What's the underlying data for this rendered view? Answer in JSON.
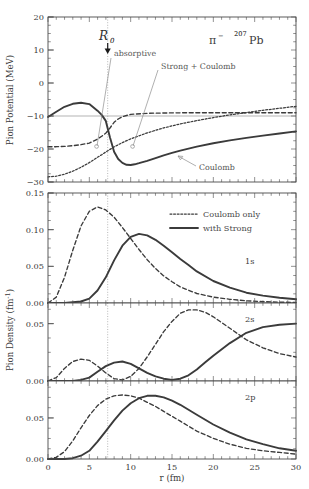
{
  "figure": {
    "system_label": "π⁻  ²⁰⁷Pb",
    "pion_symbol": "π",
    "pion_charge": "−",
    "target_mass": "207",
    "target_element": "Pb",
    "r0_label": "R",
    "r0_sub": "0",
    "r0_value": 6.5
  },
  "xaxis": {
    "label": "r (fm)",
    "min": 0,
    "max": 30,
    "ticks": [
      0,
      5,
      10,
      15,
      20,
      25,
      30
    ],
    "ticklabels": [
      "0",
      "5",
      "10",
      "15",
      "20",
      "25",
      "30"
    ],
    "minor_step": 1
  },
  "panels": {
    "potential": {
      "ylabel": "Pion Potential (MeV)",
      "ymin": -30,
      "ymax": 20,
      "ticks": [
        -30,
        -20,
        -10,
        0,
        10,
        20
      ],
      "ticklabels": [
        "−30",
        "−20",
        "−10",
        "0",
        "10",
        "20"
      ],
      "minor_step": 2.5,
      "annotations": [
        {
          "name": "absorptive",
          "text": "absorptive"
        },
        {
          "name": "strong-plus-coulomb",
          "text": "Strong + Coulomb"
        },
        {
          "name": "coulomb",
          "text": "Coulomb"
        }
      ]
    },
    "density_1s": {
      "ylabel": "Pion Density (fm⁻¹)",
      "state": "1s",
      "ymin": 0.0,
      "ymax": 0.15,
      "ticks": [
        0.0,
        0.05,
        0.1,
        0.15
      ],
      "ticklabels": [
        "0.00",
        "0.05",
        "0.10",
        "0.15"
      ],
      "minor_step": 0.0125
    },
    "density_2s": {
      "state": "2s",
      "ymin": 0.0,
      "ymax": 0.068,
      "ticks": [
        0.0,
        0.05
      ],
      "ticklabels": [
        "0.00",
        "0.05"
      ],
      "minor_step": 0.0125
    },
    "density_2p": {
      "state": "2p",
      "ymin": 0.0,
      "ymax": 0.095,
      "ticks": [
        0.0,
        0.05
      ],
      "ticklabels": [
        "0.00",
        "0.05"
      ],
      "minor_step": 0.0125
    }
  },
  "legend": {
    "position": "upper-center-right of 1s panel",
    "entries": [
      {
        "name": "coulomb-only",
        "label": "Coulomb only",
        "style": "dashed"
      },
      {
        "name": "with-strong",
        "label": "with Strong",
        "style": "solid"
      }
    ]
  },
  "chart_data": [
    {
      "type": "line",
      "name": "pion-potential",
      "title": "Pion Potential vs r",
      "xlabel": "r (fm)",
      "ylabel": "Pion Potential (MeV)",
      "xlim": [
        0,
        30
      ],
      "ylim": [
        -30,
        20
      ],
      "grid": false,
      "legend_position": "none",
      "annotations": [
        "R_0 at r = 6.5 fm",
        "absorptive",
        "Strong + Coulomb",
        "Coulomb"
      ],
      "x": [
        0,
        1,
        2,
        3,
        4,
        5,
        6,
        6.5,
        7,
        7.5,
        8,
        9,
        10,
        12,
        14,
        16,
        18,
        20,
        22,
        24,
        26,
        28,
        30
      ],
      "series": [
        {
          "name": "Strong + Coulomb (total, solid)",
          "style": "solid",
          "values": [
            -0.3,
            1.3,
            2.8,
            3.7,
            4.0,
            3.6,
            1.6,
            -1.5,
            -6.5,
            -10.8,
            -13.0,
            -13.6,
            -13.2,
            -11.8,
            -10.4,
            -9.2,
            -8.2,
            -7.3,
            -6.5,
            -5.8,
            -5.2,
            -4.6,
            -4.0
          ]
        },
        {
          "name": "absorptive (dashed)",
          "style": "dashed",
          "values": [
            -9.3,
            -9.3,
            -9.2,
            -9.0,
            -8.7,
            -8.2,
            -7.0,
            -5.2,
            -3.0,
            -1.2,
            -0.2,
            0.5,
            0.8,
            0.9,
            0.95,
            1.0,
            1.0,
            1.0,
            1.0,
            1.0,
            1.0,
            1.0,
            1.0
          ]
        },
        {
          "name": "Coulomb (dotted)",
          "style": "dotted",
          "values": [
            -26.3,
            -26.1,
            -25.5,
            -24.6,
            -23.4,
            -22.0,
            -20.4,
            -19.6,
            -18.8,
            -18.0,
            -17.3,
            -16.0,
            -14.9,
            -13.1,
            -11.6,
            -10.4,
            -9.4,
            -8.5,
            -7.7,
            -7.0,
            -6.3,
            -5.7,
            -5.1
          ]
        }
      ]
    },
    {
      "type": "line",
      "name": "pion-density-1s",
      "title": "1s pion density",
      "xlabel": "r (fm)",
      "ylabel": "Pion Density (fm⁻¹)",
      "xlim": [
        0,
        30
      ],
      "ylim": [
        0.0,
        0.15
      ],
      "state": "1s",
      "x": [
        0,
        1,
        2,
        3,
        4,
        5,
        6,
        7,
        8,
        9,
        10,
        11,
        12,
        13,
        14,
        15,
        16,
        18,
        20,
        22,
        24,
        26,
        28,
        30
      ],
      "series": [
        {
          "name": "Coulomb only",
          "style": "dashed",
          "values": [
            0.0,
            0.008,
            0.035,
            0.072,
            0.105,
            0.125,
            0.131,
            0.127,
            0.117,
            0.103,
            0.088,
            0.073,
            0.059,
            0.047,
            0.037,
            0.029,
            0.022,
            0.013,
            0.008,
            0.005,
            0.003,
            0.002,
            0.001,
            0.001
          ]
        },
        {
          "name": "with Strong",
          "style": "solid",
          "values": [
            0.0,
            0.0,
            0.0,
            0.001,
            0.002,
            0.006,
            0.017,
            0.035,
            0.058,
            0.078,
            0.09,
            0.094,
            0.092,
            0.086,
            0.078,
            0.069,
            0.06,
            0.043,
            0.03,
            0.021,
            0.014,
            0.01,
            0.007,
            0.005
          ]
        }
      ]
    },
    {
      "type": "line",
      "name": "pion-density-2s",
      "title": "2s pion density",
      "xlabel": "r (fm)",
      "ylabel": "Pion Density (fm⁻¹)",
      "xlim": [
        0,
        30
      ],
      "ylim": [
        0.0,
        0.068
      ],
      "state": "2s",
      "x": [
        0,
        1,
        2,
        3,
        4,
        5,
        6,
        7,
        8,
        9,
        10,
        11,
        12,
        13,
        14,
        15,
        16,
        17,
        18,
        19,
        20,
        22,
        24,
        26,
        28,
        30
      ],
      "series": [
        {
          "name": "Coulomb only",
          "style": "dashed",
          "values": [
            0.0,
            0.003,
            0.011,
            0.017,
            0.019,
            0.018,
            0.013,
            0.007,
            0.002,
            0.001,
            0.004,
            0.011,
            0.021,
            0.032,
            0.043,
            0.052,
            0.059,
            0.062,
            0.062,
            0.06,
            0.056,
            0.046,
            0.036,
            0.029,
            0.024,
            0.021
          ]
        },
        {
          "name": "with Strong",
          "style": "solid",
          "values": [
            0.0,
            0.0,
            0.0,
            0.0,
            0.001,
            0.003,
            0.008,
            0.013,
            0.016,
            0.017,
            0.015,
            0.011,
            0.007,
            0.004,
            0.002,
            0.001,
            0.002,
            0.005,
            0.01,
            0.016,
            0.022,
            0.033,
            0.042,
            0.047,
            0.049,
            0.05
          ]
        }
      ]
    },
    {
      "type": "line",
      "name": "pion-density-2p",
      "title": "2p pion density",
      "xlabel": "r (fm)",
      "ylabel": "Pion Density (fm⁻¹)",
      "xlim": [
        0,
        30
      ],
      "ylim": [
        0.0,
        0.095
      ],
      "state": "2p",
      "x": [
        0,
        1,
        2,
        3,
        4,
        5,
        6,
        7,
        8,
        9,
        10,
        11,
        12,
        13,
        14,
        15,
        16,
        18,
        20,
        22,
        24,
        26,
        28,
        30
      ],
      "series": [
        {
          "name": "Coulomb only",
          "style": "dashed",
          "values": [
            0.0,
            0.002,
            0.009,
            0.022,
            0.038,
            0.053,
            0.065,
            0.073,
            0.077,
            0.078,
            0.077,
            0.074,
            0.069,
            0.064,
            0.058,
            0.052,
            0.046,
            0.034,
            0.025,
            0.018,
            0.013,
            0.01,
            0.008,
            0.006
          ]
        },
        {
          "name": "with Strong",
          "style": "solid",
          "values": [
            0.0,
            0.0,
            0.0,
            0.001,
            0.004,
            0.01,
            0.021,
            0.034,
            0.047,
            0.059,
            0.068,
            0.074,
            0.077,
            0.077,
            0.075,
            0.071,
            0.066,
            0.054,
            0.042,
            0.032,
            0.024,
            0.018,
            0.013,
            0.01
          ]
        }
      ]
    }
  ]
}
